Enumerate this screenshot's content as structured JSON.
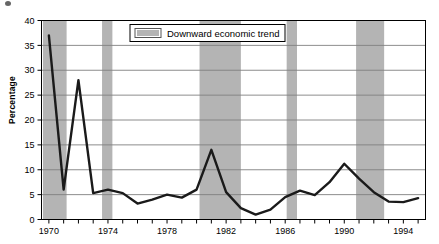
{
  "figure": {
    "ylabel": "Percentage",
    "legend_label": "Downward economic trend",
    "band_color": "#b4b4b4",
    "line_color": "#1a1a1a",
    "grid_color": "#808080",
    "axis_color": "#000000"
  },
  "chart_data": {
    "type": "line",
    "title": "",
    "xlabel": "",
    "ylabel": "Percentage",
    "xlim": [
      1969.5,
      1995.5
    ],
    "ylim": [
      0,
      40
    ],
    "yticks": [
      0,
      5,
      10,
      15,
      20,
      25,
      30,
      35,
      40
    ],
    "ytick_labels": [
      "0",
      "5",
      "10",
      "15",
      "20",
      "25",
      "30",
      "35",
      "40"
    ],
    "xticks": [
      1970,
      1971,
      1972,
      1973,
      1974,
      1975,
      1976,
      1977,
      1978,
      1979,
      1980,
      1981,
      1982,
      1983,
      1984,
      1985,
      1986,
      1987,
      1988,
      1989,
      1990,
      1991,
      1992,
      1993,
      1994,
      1995
    ],
    "xtick_labels_shown": [
      "1970",
      "1974",
      "1978",
      "1982",
      "1986",
      "1990",
      "1994"
    ],
    "grid": true,
    "grid_axis": "y",
    "legend_position": "upper center",
    "legend_entries": [
      {
        "label": "Downward economic trend",
        "type": "band",
        "color": "#b4b4b4"
      }
    ],
    "x": [
      1970,
      1971,
      1972,
      1973,
      1974,
      1975,
      1976,
      1977,
      1978,
      1979,
      1980,
      1981,
      1982,
      1983,
      1984,
      1985,
      1986,
      1987,
      1988,
      1989,
      1990,
      1991,
      1992,
      1993,
      1994,
      1995
    ],
    "series": [
      {
        "name": "Percentage",
        "values": [
          37,
          6,
          28,
          5.3,
          6,
          5.3,
          3.2,
          4,
          5,
          4.4,
          6,
          14,
          5.5,
          2.3,
          1,
          2,
          4.5,
          5.8,
          4.9,
          7.5,
          11.2,
          8.2,
          5.5,
          3.6,
          3.5,
          4.3
        ]
      }
    ],
    "shaded_bands": [
      {
        "start": 1969.6,
        "end": 1971.2,
        "label": "Downward economic trend"
      },
      {
        "start": 1973.6,
        "end": 1974.3,
        "label": "Downward economic trend"
      },
      {
        "start": 1980.2,
        "end": 1983.0,
        "label": "Downward economic trend"
      },
      {
        "start": 1986.1,
        "end": 1986.8,
        "label": "Downward economic trend"
      },
      {
        "start": 1990.8,
        "end": 1992.7,
        "label": "Downward economic trend"
      }
    ]
  }
}
